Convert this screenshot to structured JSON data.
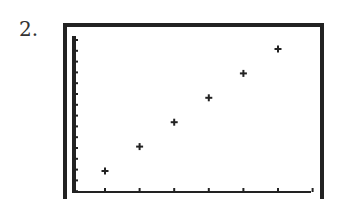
{
  "label": "2.",
  "chart_data": {
    "type": "scatter",
    "title": "",
    "xlabel": "",
    "ylabel": "",
    "x": [
      1,
      2,
      3,
      4,
      5,
      6
    ],
    "y": [
      1,
      2,
      3,
      4,
      5,
      6
    ],
    "series": [
      {
        "name": "points",
        "x": [
          1,
          2,
          3,
          4,
          5,
          6
        ],
        "y": [
          1,
          2,
          3,
          4,
          5,
          6
        ]
      }
    ],
    "x_ticks": 7,
    "y_ticks": 15,
    "grid": false,
    "legend": "none",
    "marker": "+",
    "style": "graphing-calculator screen"
  },
  "colors": {
    "ink": "#222222",
    "background": "#ffffff"
  }
}
